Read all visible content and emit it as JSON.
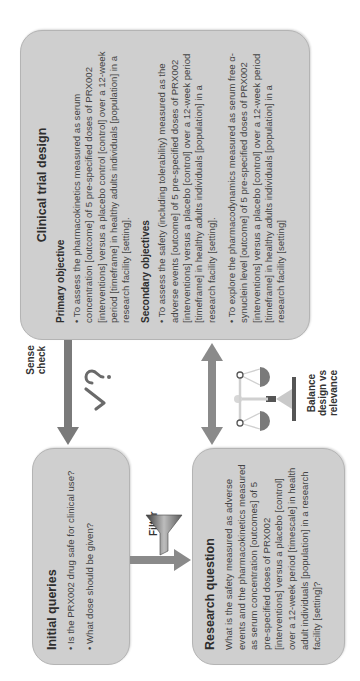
{
  "diagram": {
    "orientation": "rotated 90 degrees counter-clockwise",
    "colors": {
      "box_fill": "#cfcfcf",
      "box_border": "#b4b4b4",
      "arrow": "#7a7a7a",
      "text": "#444444"
    }
  },
  "initial_queries": {
    "title": "Initial queries",
    "items": [
      "• Is the PRX002 drug safe for clinical use?",
      "• What dose should be given?"
    ]
  },
  "research_question": {
    "title": "Research question",
    "text": "What is the safety measured as adverse events and the pharmacokinetics measured as serum concentration [outcomes] of 5 pre-specified doses of PRX002 [interventions] versus a placebo [control] over a 12-week period [timescale] in health adult individuals [population] in a research facility [setting]?"
  },
  "clinical_trial_design": {
    "title": "Clinical trial design",
    "primary": {
      "heading": "Primary objective",
      "items": [
        "• To assess the pharmacokinetics measured as serum concentration [outcome] of 5 pre-specified doses of PRX002 [interventions] versus a placebo control [control] over a 12-week period [timeframe] in healthy adults individuals [population] in a research facility [setting]."
      ]
    },
    "secondary": {
      "heading": "Secondary objectives",
      "items": [
        "• To assess the safety (including tolerability) measured as the adverse events [outcome] of 5 pre-specified doses of PRX002 [interventions] versus a placebo [control] over a 12-week period [timeframe] in healthy adults individuals [population] in a research facility [setting].",
        "• To explore the pharmacodynamics measured as serum free α-synuclein level [outcome] of 5 pre-specified doses of PRX002 [interventions] versus a placebo [control] over a 12-week period [timeframe] in healthy adults individuals [population] in a research facility [setting]"
      ]
    }
  },
  "connectors": {
    "sense_check": {
      "label": "Sense check",
      "icon": "check-question-icon"
    },
    "filter": {
      "label": "Filter",
      "icon": "funnel-icon"
    },
    "balance": {
      "label": "Balance design vs relevance",
      "icon": "scales-icon"
    }
  }
}
